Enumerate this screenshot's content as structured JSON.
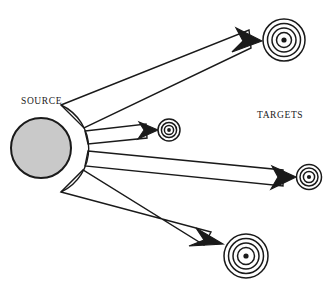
{
  "figure": {
    "type": "diagram",
    "subtype": "radial-broadcast-schematic",
    "background_color": "#ffffff",
    "stroke_color": "#1a1a1a",
    "width": 330,
    "height": 295
  },
  "labels": {
    "source": "SOURCE",
    "targets": "TARGETS"
  },
  "source_node": {
    "name": "source-circle",
    "cx": 41,
    "cy": 148,
    "r": 30,
    "fill_color": "#c9c9c9",
    "stroke_color": "#1a1a1a",
    "stroke_width": 2
  },
  "emitter_arc": {
    "name": "emitter-arc",
    "description": "arc bulging to the right of the source circle from which the beams originate",
    "cx": 41,
    "cy": 148,
    "rx": 47,
    "ry": 48,
    "start_angle_deg": -63,
    "end_angle_deg": 63
  },
  "beams": [
    {
      "name": "beam-to-target-upper-right",
      "origin_top": {
        "x": 61,
        "y": 105
      },
      "origin_bottom": {
        "x": 84,
        "y": 128
      },
      "tip": {
        "x": 262,
        "y": 41
      },
      "target": "target-upper-right"
    },
    {
      "name": "beam-to-target-center-small",
      "origin_top": {
        "x": 85,
        "y": 131
      },
      "origin_bottom": {
        "x": 88,
        "y": 144
      },
      "tip": {
        "x": 158,
        "y": 130
      },
      "target": "target-center-small"
    },
    {
      "name": "beam-to-target-right",
      "origin_top": {
        "x": 88,
        "y": 151
      },
      "origin_bottom": {
        "x": 85,
        "y": 166
      },
      "tip": {
        "x": 296,
        "y": 177
      },
      "target": "target-right"
    },
    {
      "name": "beam-to-target-lower",
      "origin_top": {
        "x": 83,
        "y": 170
      },
      "origin_bottom": {
        "x": 61,
        "y": 192
      },
      "tip": {
        "x": 223,
        "y": 244
      },
      "target": "target-lower"
    }
  ],
  "targets": [
    {
      "name": "target-upper-right",
      "cx": 284,
      "cy": 40,
      "outer_radius": 21,
      "ring_radii": [
        21,
        16.5,
        12,
        7.5
      ],
      "center_dot_radius": 2.6
    },
    {
      "name": "target-center-small",
      "cx": 169,
      "cy": 130,
      "outer_radius": 11,
      "ring_radii": [
        11,
        7.6,
        4.6
      ],
      "center_dot_radius": 1.9
    },
    {
      "name": "target-right",
      "cx": 309,
      "cy": 177,
      "outer_radius": 12.5,
      "ring_radii": [
        12.5,
        9,
        5.6
      ],
      "center_dot_radius": 2.1
    },
    {
      "name": "target-lower",
      "cx": 246,
      "cy": 256,
      "outer_radius": 22,
      "ring_radii": [
        22,
        17.5,
        13,
        8.5
      ],
      "center_dot_radius": 2.6
    }
  ]
}
